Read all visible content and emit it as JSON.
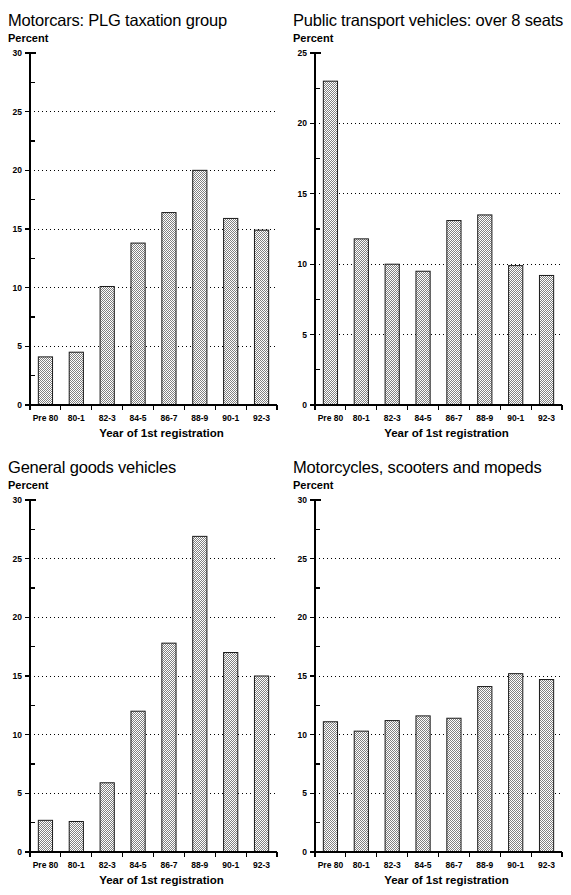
{
  "page": {
    "categories_axis_title": "Year of 1st registration",
    "value_axis_unit": "Percent"
  },
  "chart_data": [
    {
      "type": "bar",
      "title": "Motorcars: PLG taxation group",
      "xlabel": "Year of 1st registration",
      "ylabel": "Percent",
      "categories": [
        "Pre 80",
        "80-1",
        "82-3",
        "84-5",
        "86-7",
        "88-9",
        "90-1",
        "92-3"
      ],
      "values": [
        4.1,
        4.5,
        10.1,
        13.8,
        16.4,
        20.0,
        15.9,
        14.9
      ],
      "ylim": [
        0,
        30
      ],
      "ytick_major": 5,
      "ytick_minor": 2.5,
      "ytick_labels": [
        "0",
        "5",
        "10",
        "15",
        "20",
        "25",
        "30"
      ],
      "grid": "horizontal-dotted",
      "legend": "none"
    },
    {
      "type": "bar",
      "title": "Public transport vehicles: over 8 seats",
      "xlabel": "Year of 1st registration",
      "ylabel": "Percent",
      "categories": [
        "Pre 80",
        "80-1",
        "82-3",
        "84-5",
        "86-7",
        "88-9",
        "90-1",
        "92-3"
      ],
      "values": [
        23.0,
        11.8,
        10.0,
        9.5,
        13.1,
        13.5,
        9.9,
        9.2
      ],
      "ylim": [
        0,
        25
      ],
      "ytick_major": 5,
      "ytick_minor": 2.5,
      "ytick_labels": [
        "0",
        "5",
        "10",
        "15",
        "20",
        "25"
      ],
      "grid": "horizontal-dotted",
      "legend": "none"
    },
    {
      "type": "bar",
      "title": "General goods vehicles",
      "xlabel": "Year of 1st registration",
      "ylabel": "Percent",
      "categories": [
        "Pre 80",
        "80-1",
        "82-3",
        "84-5",
        "86-7",
        "88-9",
        "90-1",
        "92-3"
      ],
      "values": [
        2.7,
        2.6,
        5.9,
        12.0,
        17.8,
        26.9,
        17.0,
        15.0
      ],
      "ylim": [
        0,
        30
      ],
      "ytick_major": 5,
      "ytick_minor": 2.5,
      "ytick_labels": [
        "0",
        "5",
        "10",
        "15",
        "20",
        "25",
        "30"
      ],
      "grid": "horizontal-dotted",
      "legend": "none"
    },
    {
      "type": "bar",
      "title": "Motorcycles, scooters and mopeds",
      "xlabel": "Year of 1st registration",
      "ylabel": "Percent",
      "categories": [
        "Pre 80",
        "80-1",
        "82-3",
        "84-5",
        "86-7",
        "88-9",
        "90-1",
        "92-3"
      ],
      "values": [
        11.1,
        10.3,
        11.2,
        11.6,
        11.4,
        14.1,
        15.2,
        14.7
      ],
      "ylim": [
        0,
        30
      ],
      "ytick_major": 5,
      "ytick_minor": 2.5,
      "ytick_labels": [
        "0",
        "5",
        "10",
        "15",
        "20",
        "25",
        "30"
      ],
      "grid": "horizontal-dotted",
      "legend": "none"
    }
  ],
  "colors": {
    "bar_fill": "#c9c9c9",
    "bar_stroke": "#1a1a1a",
    "axis": "#000000",
    "background": "#ffffff"
  }
}
